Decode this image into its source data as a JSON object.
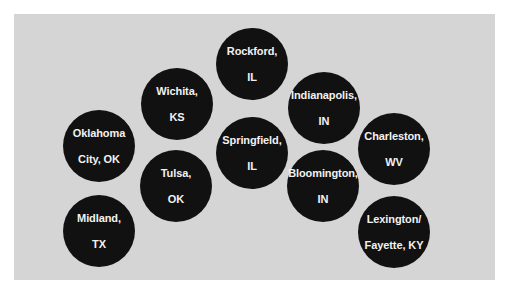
{
  "colors": {
    "background": "#ffffff",
    "panel": "#d5d5d5",
    "circle": "#111111",
    "text": "#f2f2f2"
  },
  "cities": [
    {
      "line1": "Rockford,",
      "line2": "IL",
      "x": 252,
      "y": 64
    },
    {
      "line1": "Wichita,",
      "line2": "KS",
      "x": 177,
      "y": 104
    },
    {
      "line1": "Indianapolis,",
      "line2": "IN",
      "x": 324,
      "y": 108
    },
    {
      "line1": "Oklahoma",
      "line2": "City, OK",
      "x": 99,
      "y": 146
    },
    {
      "line1": "Springfield,",
      "line2": "IL",
      "x": 252,
      "y": 153
    },
    {
      "line1": "Charleston,",
      "line2": "WV",
      "x": 394,
      "y": 149
    },
    {
      "line1": "Tulsa,",
      "line2": "OK",
      "x": 176,
      "y": 186
    },
    {
      "line1": "Bloomington,",
      "line2": "IN",
      "x": 323,
      "y": 186
    },
    {
      "line1": "Midland,",
      "line2": "TX",
      "x": 99,
      "y": 231
    },
    {
      "line1": "Lexington/",
      "line2": "Fayette, KY",
      "x": 394,
      "y": 232
    }
  ]
}
